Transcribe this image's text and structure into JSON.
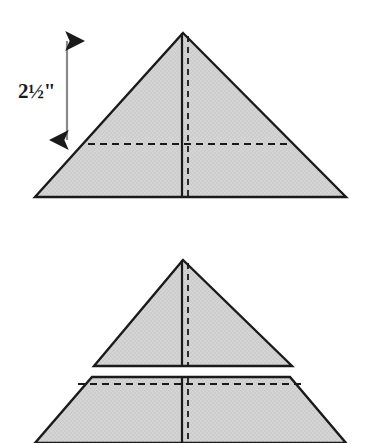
{
  "figure": {
    "background_color": "#ffffff",
    "fill_color": "#cdcdcd",
    "stroke_color": "#1a1a1a",
    "dashed_color": "#1a1a1a"
  },
  "annotations": {
    "dimension_label": "2½\"",
    "dimension_value": "2.5",
    "dimension_unit": "inches"
  },
  "shapes": {
    "top_triangle": {
      "name": "large-triangle",
      "apex": [
        183,
        33
      ],
      "left_vertex": [
        35,
        197
      ],
      "right_vertex": [
        346,
        197
      ],
      "center_fold_solid_x": 182,
      "center_fold_dashed_x": 188,
      "horizontal_dashed_y": 144,
      "horizontal_dashed_x1": 88,
      "horizontal_dashed_x2": 291
    },
    "middle_triangle": {
      "name": "small-triangle",
      "apex": [
        183,
        260
      ],
      "left_vertex": [
        94,
        366
      ],
      "right_vertex": [
        292,
        366
      ],
      "center_fold_solid_x": 182,
      "center_fold_dashed_x": 188
    },
    "bottom_trapezoid": {
      "name": "trapezoid",
      "top_left": [
        92,
        377
      ],
      "top_right": [
        290,
        377
      ],
      "bottom_left": [
        35,
        443
      ],
      "bottom_right": [
        346,
        443
      ],
      "seam_dashed_y": 384,
      "seam_dashed_x1": 70,
      "seam_dashed_x2": 312,
      "center_fold_solid_x": 182,
      "center_fold_dashed_x": 188
    }
  },
  "dimension_arrow": {
    "name": "vertical-dimension-arrow",
    "x": 67,
    "top_y": 35,
    "bottom_y": 146,
    "label_x": 38,
    "label_y": 98
  }
}
